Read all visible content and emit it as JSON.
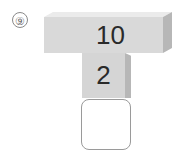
{
  "problem": {
    "number_label": "⑨",
    "top_block_value": "10",
    "middle_block_value": "2",
    "answer_value": ""
  },
  "colors": {
    "block_front": "#d9d9d9",
    "block_top": "#ebebeb",
    "block_side": "#b7b7b7",
    "text": "#2a2a2a",
    "answer_border": "#9a9a9a"
  }
}
